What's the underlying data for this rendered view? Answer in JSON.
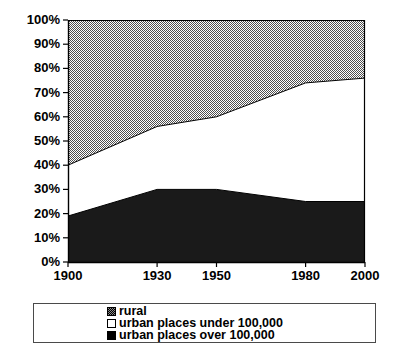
{
  "chart_data": {
    "type": "area",
    "title": "",
    "subtitle": "",
    "xlabel": "",
    "ylabel": "",
    "stacked": true,
    "normalized_percent": true,
    "grid": false,
    "legend_position": "bottom",
    "x": [
      1900,
      1930,
      1950,
      1980,
      2000
    ],
    "categories": [
      "1900",
      "1930",
      "1950",
      "1980",
      "2000"
    ],
    "xlim": [
      1900,
      2000
    ],
    "ylim": [
      0,
      100
    ],
    "ytick_labels": [
      "0%",
      "10%",
      "20%",
      "30%",
      "40%",
      "50%",
      "60%",
      "70%",
      "80%",
      "90%",
      "100%"
    ],
    "ytick_values": [
      0,
      10,
      20,
      30,
      40,
      50,
      60,
      70,
      80,
      90,
      100
    ],
    "xtick_labels": [
      "1900",
      "1930",
      "1950",
      "1980",
      "2000"
    ],
    "xtick_values": [
      1900,
      1930,
      1950,
      1980,
      2000
    ],
    "series": [
      {
        "name": "urban places over 100,000",
        "fill": "black",
        "color": "#1a1a1a",
        "values": [
          19,
          30,
          30,
          25,
          25
        ]
      },
      {
        "name": "urban places under 100,000",
        "fill": "white",
        "color": "#ffffff",
        "values": [
          21,
          26,
          30,
          49,
          51
        ]
      },
      {
        "name": "rural",
        "fill": "checkerboard-gray",
        "color": "#8a8a8a",
        "values": [
          60,
          44,
          40,
          26,
          24
        ]
      }
    ],
    "cumulative_boundaries": {
      "over_100k_top": [
        19,
        30,
        30,
        25,
        25
      ],
      "under_100k_top": [
        40,
        56,
        60,
        74,
        76
      ],
      "total_top": [
        100,
        100,
        100,
        100,
        100
      ]
    }
  },
  "axis": {
    "y_labels": [
      "100%",
      "90%",
      "80%",
      "70%",
      "60%",
      "50%",
      "40%",
      "30%",
      "20%",
      "10%",
      "0%"
    ],
    "x_labels": [
      "1900",
      "1930",
      "1950",
      "1980",
      "2000"
    ]
  },
  "legend": {
    "items": [
      {
        "label": "rural",
        "swatch": "checkerboard-gray-swatch"
      },
      {
        "label": "urban places under 100,000",
        "swatch": "white-swatch"
      },
      {
        "label": "urban places over 100,000",
        "swatch": "black-swatch"
      }
    ]
  },
  "colors": {
    "rural": "#8a8a8a",
    "urban_under": "#ffffff",
    "urban_over": "#1a1a1a",
    "axis": "#000000",
    "legend_border": "#4a4a4a",
    "background": "#ffffff"
  }
}
